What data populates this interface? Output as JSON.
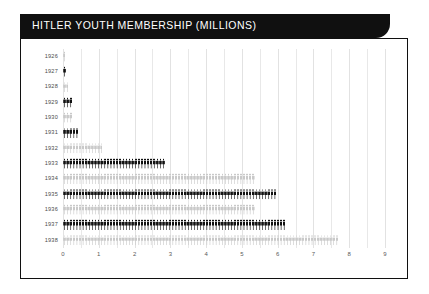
{
  "header": {
    "title": "HITLER YOUTH MEMBERSHIP (MILLIONS)",
    "background_color": "#101010",
    "text_color": "#ffffff"
  },
  "colors": {
    "bar_dark": "#111111",
    "bar_light": "#c9c9c9",
    "gridline": "#e8e8e8",
    "panel_border": "#101010",
    "axis_text": "#5a5a5a",
    "year_text": "#4a4a4a"
  },
  "chart_data": {
    "type": "bar",
    "orientation": "horizontal",
    "title": "HITLER YOUTH MEMBERSHIP (MILLIONS)",
    "xlabel": "",
    "ylabel": "",
    "unit": "millions",
    "glyph": "person-pictogram",
    "xlim": [
      0,
      9
    ],
    "xticks": [
      "0",
      "1",
      "2",
      "3",
      "4",
      "5",
      "6",
      "7",
      "8",
      "9"
    ],
    "grid": true,
    "grid_interval": 0.5,
    "legend": "none",
    "categories": [
      "1926",
      "1927",
      "1928",
      "1929",
      "1930",
      "1931",
      "1932",
      "1933",
      "1934",
      "1935",
      "1936",
      "1937",
      "1938"
    ],
    "values": [
      0.06,
      0.07,
      0.13,
      0.25,
      0.26,
      0.42,
      1.1,
      2.9,
      5.4,
      6.0,
      5.4,
      6.2,
      7.7
    ],
    "bar_styles": [
      "light",
      "dark",
      "light",
      "dark",
      "light",
      "dark",
      "light",
      "dark",
      "light",
      "dark",
      "light",
      "dark",
      "light"
    ],
    "bars": [
      {
        "year": "1926",
        "value": 0.06,
        "style": "light"
      },
      {
        "year": "1927",
        "value": 0.07,
        "style": "dark"
      },
      {
        "year": "1928",
        "value": 0.13,
        "style": "light"
      },
      {
        "year": "1929",
        "value": 0.25,
        "style": "dark"
      },
      {
        "year": "1930",
        "value": 0.26,
        "style": "light"
      },
      {
        "year": "1931",
        "value": 0.42,
        "style": "dark"
      },
      {
        "year": "1932",
        "value": 1.1,
        "style": "light"
      },
      {
        "year": "1933",
        "value": 2.9,
        "style": "dark"
      },
      {
        "year": "1934",
        "value": 5.4,
        "style": "light"
      },
      {
        "year": "1935",
        "value": 6.0,
        "style": "dark"
      },
      {
        "year": "1936",
        "value": 5.4,
        "style": "light"
      },
      {
        "year": "1937",
        "value": 6.2,
        "style": "dark"
      },
      {
        "year": "1938",
        "value": 7.7,
        "style": "light"
      }
    ]
  }
}
